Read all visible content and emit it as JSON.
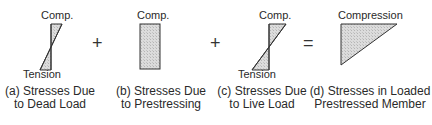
{
  "panels": [
    {
      "id": "a",
      "top_label": "Comp.",
      "bottom_label": "Tension",
      "caption_line1": "(a) Stresses Due",
      "caption_line2": "to Dead Load",
      "shape": "bowtie"
    },
    {
      "id": "b",
      "top_label": "Comp.",
      "caption_line1": "(b) Stresses Due",
      "caption_line2": "to Prestressing",
      "shape": "rectangle"
    },
    {
      "id": "c",
      "top_label": "Comp.",
      "bottom_label": "Tension",
      "caption_line1": "(c) Stresses Due",
      "caption_line2": "to Live Load",
      "shape": "bowtie"
    },
    {
      "id": "d",
      "top_label": "Compression",
      "caption_line1": "(d) Stresses in Loaded",
      "caption_line2": "Prestressed Member",
      "shape": "triangle"
    }
  ],
  "operators": [
    "+",
    "+",
    "="
  ],
  "colors": {
    "fill": "#d6d6d6",
    "stroke": "#333333"
  }
}
